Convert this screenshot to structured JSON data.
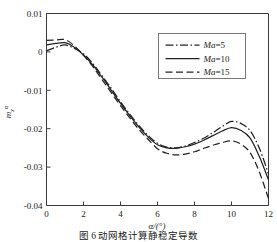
{
  "caption": "图 6  动网格计算静稳定导数",
  "chart_data": {
    "type": "line",
    "title": "",
    "subtitle": "",
    "xlabel": "α/(°)",
    "ylabel": "m_z^α",
    "ylabel_base": "m",
    "ylabel_sub": "z",
    "ylabel_sup": "α",
    "xlim": [
      0,
      12
    ],
    "ylim": [
      -0.04,
      0.01
    ],
    "xticks": [
      0,
      2,
      4,
      6,
      8,
      10,
      12
    ],
    "xtick_labels": [
      "0",
      "2",
      "4",
      "6",
      "8",
      "10",
      "12"
    ],
    "yticks": [
      0.01,
      0,
      -0.01,
      -0.02,
      -0.03,
      -0.04
    ],
    "ytick_labels": [
      "0.01",
      "0",
      "-0.01",
      "-0.02",
      "-0.03",
      "-0.04"
    ],
    "grid": false,
    "legend_position": "upper right",
    "legend_border": true,
    "x": [
      0,
      0.5,
      1,
      1.5,
      2,
      2.5,
      3,
      3.5,
      4,
      4.5,
      5,
      5.5,
      6,
      6.5,
      7,
      7.5,
      8,
      8.5,
      9,
      9.5,
      10,
      10.5,
      11,
      11.5,
      12
    ],
    "series": [
      {
        "name": "Ma=5",
        "label_prefix": "Ma",
        "label_value": "=5",
        "style": "dashdot",
        "dash": "8,2.5,1.5,2.5",
        "values": [
          0.0003,
          0.0012,
          0.0018,
          0.0009,
          -0.0005,
          -0.003,
          -0.0062,
          -0.0095,
          -0.013,
          -0.0162,
          -0.0192,
          -0.0218,
          -0.0238,
          -0.0248,
          -0.025,
          -0.0245,
          -0.0236,
          -0.0225,
          -0.021,
          -0.0194,
          -0.0181,
          -0.0186,
          -0.0205,
          -0.025,
          -0.0318
        ]
      },
      {
        "name": "Ma=10",
        "label_prefix": "Ma",
        "label_value": "=10",
        "style": "solid",
        "dash": "none",
        "values": [
          0.0018,
          0.0022,
          0.0024,
          0.0012,
          -0.0008,
          -0.0034,
          -0.0066,
          -0.01,
          -0.0134,
          -0.0166,
          -0.0196,
          -0.0222,
          -0.0242,
          -0.025,
          -0.0251,
          -0.0247,
          -0.024,
          -0.023,
          -0.0218,
          -0.0206,
          -0.0197,
          -0.0204,
          -0.0224,
          -0.0272,
          -0.0333
        ]
      },
      {
        "name": "Ma=15",
        "label_prefix": "Ma",
        "label_value": "=15",
        "style": "dashed",
        "dash": "7,3.5",
        "values": [
          0.003,
          0.0031,
          0.0032,
          0.0016,
          -0.0009,
          -0.0038,
          -0.0072,
          -0.0106,
          -0.014,
          -0.0172,
          -0.0202,
          -0.0228,
          -0.0252,
          -0.0264,
          -0.0268,
          -0.0266,
          -0.026,
          -0.0251,
          -0.0243,
          -0.0236,
          -0.0232,
          -0.024,
          -0.0262,
          -0.0312,
          -0.0382
        ]
      }
    ]
  }
}
